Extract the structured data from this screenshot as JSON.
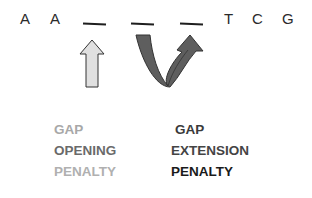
{
  "sequence": {
    "letters": [
      "A",
      "A",
      "T",
      "C",
      "G"
    ],
    "gaps": [
      "_",
      "_",
      "_"
    ]
  },
  "arrows": {
    "opening": {
      "icon": "straight-up-arrow-icon",
      "color": "#e0e0e0",
      "stroke": "#333333"
    },
    "extension": {
      "icon": "u-turn-arrow-icon",
      "color": "#666666",
      "stroke": "#333333"
    }
  },
  "labels": {
    "opening": {
      "line1": "GAP",
      "line2": "OPENING",
      "line3": "PENALTY",
      "colors": [
        "#a8a8a8",
        "#6a6a6a",
        "#b0b0b0"
      ]
    },
    "extension": {
      "line1": "GAP",
      "line2": "EXTENSION",
      "line3": "PENALTY",
      "colors": [
        "#3a3a3a",
        "#444444",
        "#1a1a1a"
      ]
    }
  }
}
